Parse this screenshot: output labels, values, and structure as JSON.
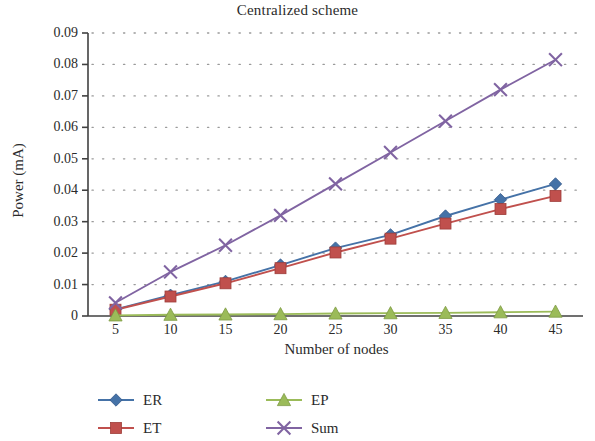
{
  "chart_data": {
    "type": "line",
    "title": "Centralized scheme",
    "xlabel": "Number of nodes",
    "ylabel": "Power (mA)",
    "x": [
      5,
      10,
      15,
      20,
      25,
      30,
      35,
      40,
      45
    ],
    "xtick_labels": [
      "5",
      "10",
      "15",
      "20",
      "25",
      "30",
      "35",
      "40",
      "45"
    ],
    "ytick_labels": [
      "0",
      "0.01",
      "0.02",
      "0.03",
      "0.04",
      "0.05",
      "0.06",
      "0.07",
      "0.08",
      "0.09"
    ],
    "ytick_values": [
      0,
      0.01,
      0.02,
      0.03,
      0.04,
      0.05,
      0.06,
      0.07,
      0.08,
      0.09
    ],
    "xlim": [
      2.5,
      47.5
    ],
    "ylim": [
      0,
      0.09
    ],
    "grid": "horizontal-dotted",
    "legend_position": "bottom",
    "series": [
      {
        "name": "ER",
        "color": "#4572a7",
        "marker": "diamond",
        "values": [
          0.0021,
          0.0066,
          0.011,
          0.0162,
          0.0216,
          0.0258,
          0.0318,
          0.037,
          0.042
        ]
      },
      {
        "name": "ET",
        "color": "#c0504d",
        "marker": "square",
        "values": [
          0.002,
          0.0062,
          0.0104,
          0.0152,
          0.0202,
          0.0246,
          0.0294,
          0.034,
          0.0382
        ]
      },
      {
        "name": "EP",
        "color": "#9bbb59",
        "marker": "triangle",
        "values": [
          0.0002,
          0.0004,
          0.0005,
          0.0006,
          0.0008,
          0.0009,
          0.001,
          0.0012,
          0.0014
        ]
      },
      {
        "name": "Sum",
        "color": "#8064a2",
        "marker": "cross",
        "values": [
          0.0042,
          0.014,
          0.0225,
          0.032,
          0.042,
          0.052,
          0.062,
          0.072,
          0.0815
        ]
      }
    ]
  },
  "legend": {
    "entries": [
      {
        "label": "ER",
        "marker": "diamond-marker",
        "color": "#4572a7"
      },
      {
        "label": "EP",
        "marker": "triangle-marker",
        "color": "#9bbb59"
      },
      {
        "label": "ET",
        "marker": "square-marker",
        "color": "#c0504d"
      },
      {
        "label": "Sum",
        "marker": "cross-marker",
        "color": "#8064a2"
      }
    ]
  },
  "axes": {
    "axis_color": "#404040",
    "grid_color": "#9a9a9a",
    "text_color": "#2b2b2b"
  }
}
